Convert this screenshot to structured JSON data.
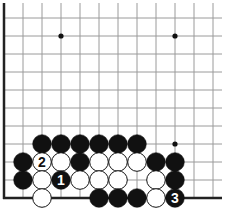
{
  "diagram": {
    "type": "go-board-fragment",
    "visible_corner": "bottom-left",
    "grid": {
      "columns": 12,
      "rows": 11,
      "origin_x": 4,
      "origin_y": 198,
      "spacing_x": 19,
      "spacing_y": 18,
      "line_color": "#9a9a9a",
      "edge_color": "#222222"
    },
    "star_points": [
      {
        "col": 3,
        "row": 9
      },
      {
        "col": 9,
        "row": 9
      },
      {
        "col": 9,
        "row": 3
      }
    ],
    "stones": [
      {
        "color": "black",
        "col": 2,
        "row": 3
      },
      {
        "color": "black",
        "col": 3,
        "row": 3
      },
      {
        "color": "black",
        "col": 4,
        "row": 3
      },
      {
        "color": "black",
        "col": 5,
        "row": 3
      },
      {
        "color": "black",
        "col": 6,
        "row": 3
      },
      {
        "color": "black",
        "col": 7,
        "row": 3
      },
      {
        "color": "black",
        "col": 1,
        "row": 2
      },
      {
        "color": "white",
        "col": 2,
        "row": 2,
        "label": "2"
      },
      {
        "color": "white",
        "col": 3,
        "row": 2
      },
      {
        "color": "black",
        "col": 4,
        "row": 2
      },
      {
        "color": "white",
        "col": 5,
        "row": 2
      },
      {
        "color": "white",
        "col": 6,
        "row": 2
      },
      {
        "color": "white",
        "col": 7,
        "row": 2
      },
      {
        "color": "black",
        "col": 8,
        "row": 2
      },
      {
        "color": "black",
        "col": 9,
        "row": 2
      },
      {
        "color": "black",
        "col": 1,
        "row": 1
      },
      {
        "color": "white",
        "col": 2,
        "row": 1
      },
      {
        "color": "black",
        "col": 3,
        "row": 1,
        "label": "1"
      },
      {
        "color": "white",
        "col": 4,
        "row": 1
      },
      {
        "color": "white",
        "col": 5,
        "row": 1
      },
      {
        "color": "white",
        "col": 6,
        "row": 1
      },
      {
        "color": "white",
        "col": 8,
        "row": 1
      },
      {
        "color": "black",
        "col": 9,
        "row": 1
      },
      {
        "color": "white",
        "col": 2,
        "row": 0
      },
      {
        "color": "black",
        "col": 5,
        "row": 0
      },
      {
        "color": "black",
        "col": 6,
        "row": 0
      },
      {
        "color": "black",
        "col": 7,
        "row": 0
      },
      {
        "color": "white",
        "col": 8,
        "row": 0
      },
      {
        "color": "black",
        "col": 9,
        "row": 0,
        "label": "3"
      }
    ],
    "move_labels": [
      "1",
      "2",
      "3"
    ]
  }
}
